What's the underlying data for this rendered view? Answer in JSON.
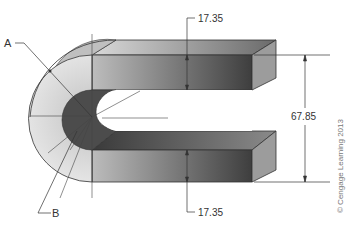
{
  "figure": {
    "labels": {
      "point_a": "A",
      "point_b": "B"
    },
    "dimensions": {
      "top_thickness": "17.35",
      "bottom_thickness": "17.35",
      "overall_height": "67.85"
    },
    "copyright": "© Cengage Learning 2013",
    "colors": {
      "top_face_light": "#cfcfcf",
      "front_face_dark": "#5a5a5a",
      "end_face": "#9a9a9a",
      "bend_light": "#d6d6d6",
      "bend_inner_dark": "#4a4a4a",
      "lines": "#333333"
    }
  }
}
